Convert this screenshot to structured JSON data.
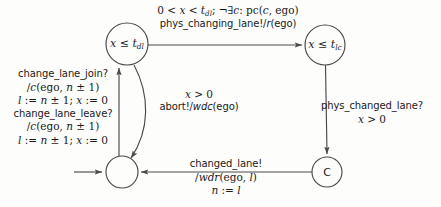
{
  "diagram": {
    "background": "#fdfdfc",
    "stroke": "#4a4a4a",
    "text_color": "#1a1a1a",
    "states": [
      {
        "id": "dl",
        "name": "state-x-le-tdl",
        "label_html": "x ≤ t<sub>dl</sub>",
        "label_text": "x ≤ t_dl",
        "cx": 127,
        "cy": 44,
        "r": 21
      },
      {
        "id": "lc",
        "name": "state-x-le-tlc",
        "label_html": "x ≤ t<sub>lc</sub>",
        "label_text": "x ≤ t_lc",
        "cx": 325,
        "cy": 45,
        "r": 20
      },
      {
        "id": "initial",
        "name": "state-initial",
        "label_html": "",
        "label_text": "",
        "cx": 122,
        "cy": 172,
        "r": 16
      },
      {
        "id": "c",
        "name": "state-c",
        "label_html": "C",
        "label_text": "C",
        "cx": 327,
        "cy": 172,
        "r": 15
      }
    ],
    "edges": [
      {
        "id": "dl-to-lc",
        "name": "edge-dl-to-lc",
        "from": "dl",
        "to": "lc",
        "label": {
          "x": 228,
          "y": 17,
          "lines": [
            {
              "text": "0 < x < t_dl; ¬∃c: pc(c, ego)",
              "html": "0 &lt; <i>x</i> &lt; <i>t</i><sub>dl</sub>; ¬∃<i>c</i>: pc(<i>c</i>, ego)",
              "style": "serif"
            },
            {
              "text": "phys_changing_lane!/r(ego)",
              "html": "phys_changing_lane!/<i>r</i>(ego)",
              "style": "mixed"
            }
          ]
        }
      },
      {
        "id": "lc-to-c",
        "name": "edge-lc-to-c",
        "from": "lc",
        "to": "c",
        "label": {
          "x": 372,
          "y": 113,
          "lines": [
            {
              "text": "phys_changed_lane?",
              "html": "phys_changed_lane?",
              "style": "sans"
            },
            {
              "text": "x > 0",
              "html": "<i>x</i> &gt; 0",
              "style": "serif"
            }
          ]
        }
      },
      {
        "id": "c-to-initial",
        "name": "edge-c-to-initial",
        "from": "c",
        "to": "initial",
        "label": {
          "x": 226,
          "y": 178,
          "lines": [
            {
              "text": "changed_lane!",
              "html": "changed_lane!",
              "style": "sans"
            },
            {
              "text": "/wdr(ego, l)",
              "html": "/<i>wdr</i>(ego, <i>l</i>)",
              "style": "serif"
            },
            {
              "text": "n := l",
              "html": "<i>n</i> := <i>l</i>",
              "style": "serif"
            }
          ]
        }
      },
      {
        "id": "initial-to-dl",
        "name": "edge-initial-to-dl",
        "from": "initial",
        "to": "dl",
        "label": {
          "x": 63,
          "y": 108,
          "lines": [
            {
              "text": "change_lane_join?",
              "html": "change_lane_join?",
              "style": "sans"
            },
            {
              "text": "/c(ego, n ± 1)",
              "html": "/<i>c</i>(ego, <i>n</i> ± 1)",
              "style": "serif"
            },
            {
              "text": "l := n ± 1; x := 0",
              "html": "<i>l</i> := <i>n</i> ± 1; <i>x</i> := 0",
              "style": "serif"
            },
            {
              "text": "change_lane_leave?",
              "html": "change_lane_leave?",
              "style": "sans"
            },
            {
              "text": "/c(ego, n ± 1)",
              "html": "/<i>c</i>(ego, <i>n</i> ± 1)",
              "style": "serif"
            },
            {
              "text": "l := n ± 1; x := 0",
              "html": "<i>l</i> := <i>n</i> ± 1; <i>x</i> := 0",
              "style": "serif"
            }
          ]
        }
      },
      {
        "id": "dl-to-initial",
        "name": "edge-dl-to-initial",
        "from": "dl",
        "to": "initial",
        "label": {
          "x": 199,
          "y": 101,
          "lines": [
            {
              "text": "x > 0",
              "html": "<i>x</i> &gt; 0",
              "style": "serif"
            },
            {
              "text": "abort!/wdc(ego)",
              "html": "abort!/<i>wdc</i>(ego)",
              "style": "mixed"
            }
          ]
        }
      },
      {
        "id": "start-arrow",
        "name": "edge-start-arrow",
        "from": "",
        "to": "initial",
        "label": null
      }
    ]
  }
}
